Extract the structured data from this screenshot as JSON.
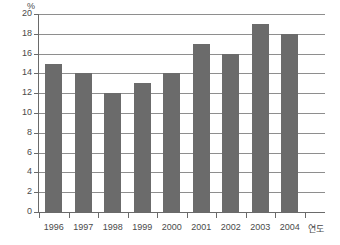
{
  "chart_data": {
    "type": "bar",
    "title": "",
    "xlabel": "연도",
    "ylabel": "%",
    "categories": [
      "1996",
      "1997",
      "1998",
      "1999",
      "2000",
      "2001",
      "2002",
      "2003",
      "2004"
    ],
    "values": [
      15,
      14,
      12,
      13,
      14,
      17,
      16,
      19,
      18
    ],
    "ylim": [
      0,
      20
    ],
    "ytick_labels": [
      "0",
      "2",
      "4",
      "6",
      "8",
      "10",
      "12",
      "14",
      "16",
      "18",
      "20"
    ],
    "ytick_values": [
      0,
      2,
      4,
      6,
      8,
      10,
      12,
      14,
      16,
      18,
      20
    ],
    "grid": true,
    "legend": null,
    "bar_color": "#6b6b6b",
    "axis_color": "#6a6a6a",
    "grid_color": "#8e8e8e"
  }
}
